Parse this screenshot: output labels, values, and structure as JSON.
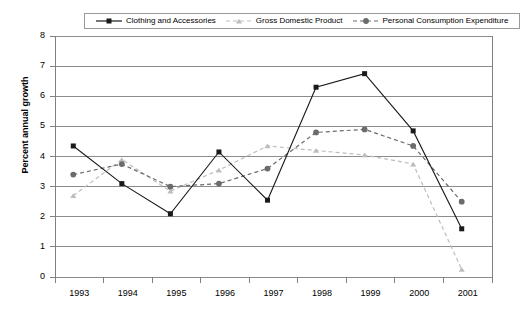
{
  "chart_data": {
    "type": "line",
    "title": "",
    "xlabel": "",
    "ylabel": "Percent annual growth",
    "categories": [
      "1993",
      "1994",
      "1995",
      "1996",
      "1997",
      "1998",
      "1999",
      "2000",
      "2001"
    ],
    "ylim": [
      0,
      8
    ],
    "ytick_labels": [
      "0",
      "1",
      "2",
      "3",
      "4",
      "5",
      "6",
      "7",
      "8"
    ],
    "ytick_values": [
      0,
      1,
      2,
      3,
      4,
      5,
      6,
      7,
      8
    ],
    "grid": "horizontal",
    "legend_position": "top-center",
    "series": [
      {
        "name": "Clothing and Accessories",
        "marker": "square",
        "line_style": "solid",
        "color": "#1a1a1a",
        "values": [
          4.35,
          3.1,
          2.1,
          4.15,
          2.55,
          6.3,
          6.75,
          4.85,
          1.6
        ]
      },
      {
        "name": "Gross Domestic Product",
        "marker": "triangle",
        "line_style": "dashed",
        "color": "#bdbdbd",
        "values": [
          2.7,
          3.9,
          2.85,
          3.55,
          4.35,
          4.2,
          4.05,
          3.75,
          0.25
        ]
      },
      {
        "name": "Personal Consumption Expenditure",
        "marker": "circle",
        "line_style": "dashed",
        "color": "#6b6b6b",
        "values": [
          3.4,
          3.75,
          3.0,
          3.1,
          3.6,
          4.8,
          4.9,
          4.35,
          2.5
        ]
      }
    ]
  },
  "axis": {
    "frame_color": "#808080",
    "grid_color": "#8c8c8c"
  }
}
